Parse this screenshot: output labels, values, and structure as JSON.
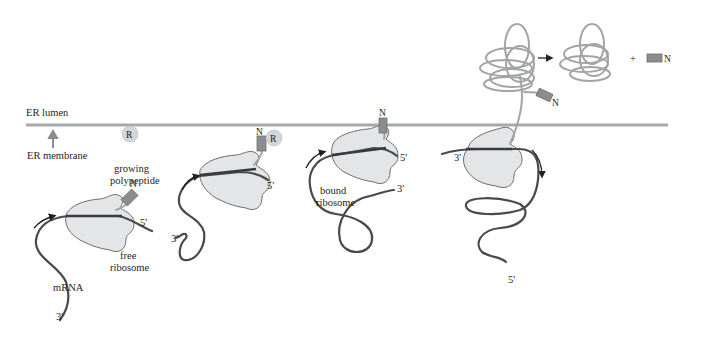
{
  "labels": {
    "er_lumen": "ER lumen",
    "er_membrane": "ER membrane",
    "growing_polypeptide_1": "growing",
    "growing_polypeptide_2": "polypeptide",
    "free_ribosome_1": "free",
    "free_ribosome_2": "ribosome",
    "bound_ribosome_1": "bound",
    "bound_ribosome_2": "ribosome",
    "mrna": "mRNA",
    "srp": "R",
    "n_terminus": "N",
    "five_prime": "5'",
    "three_prime": "3'",
    "plus": "+"
  },
  "colors": {
    "membrane": "#a7a9ac",
    "ribosome_fill": "#e4e5e6",
    "signal_peptide": "#8b8c8e",
    "mrna": "#4a4a4c",
    "polypeptide": "#a3a4a6"
  },
  "stages": [
    {
      "name": "free-ribosome-stage"
    },
    {
      "name": "srp-binding-stage"
    },
    {
      "name": "bound-ribosome-stage"
    },
    {
      "name": "translocation-stage"
    },
    {
      "name": "cleavage-product-stage"
    }
  ]
}
